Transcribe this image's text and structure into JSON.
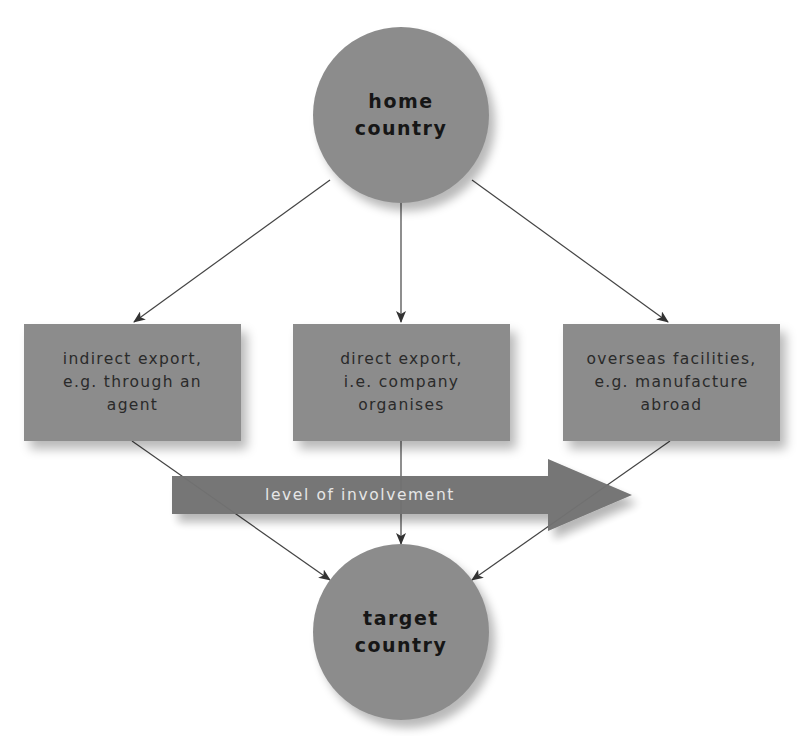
{
  "diagram": {
    "source_node": {
      "label_line1": "home",
      "label_line2": "country"
    },
    "target_node": {
      "label_line1": "target",
      "label_line2": "country"
    },
    "options": [
      {
        "line1": "indirect export,",
        "line2": "e.g. through an",
        "line3": "agent"
      },
      {
        "line1": "direct export,",
        "line2": "i.e. company",
        "line3": "organises"
      },
      {
        "line1": "overseas facilities,",
        "line2": "e.g. manufacture",
        "line3": "abroad"
      }
    ],
    "involvement_arrow": {
      "label": "level of involvement",
      "direction": "right"
    },
    "colors": {
      "node_fill": "#8c8c8c",
      "arrow_fill": "#707070",
      "line": "#3a3a3a",
      "background": "#ffffff"
    }
  }
}
